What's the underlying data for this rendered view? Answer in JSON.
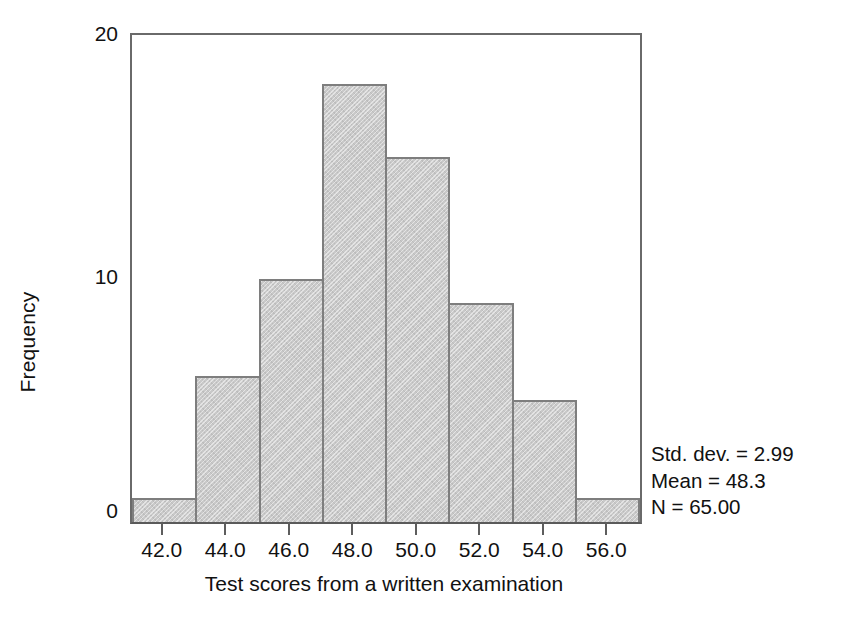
{
  "chart_data": {
    "type": "bar",
    "title": "",
    "subtitle": "",
    "xlabel": "Test scores from a written examination",
    "ylabel": "Frequency",
    "categories": [
      "42.0",
      "44.0",
      "46.0",
      "48.0",
      "50.0",
      "52.0",
      "54.0",
      "56.0"
    ],
    "values": [
      1,
      6,
      10,
      18,
      15,
      9,
      5,
      1
    ],
    "x": [
      42.0,
      44.0,
      46.0,
      48.0,
      50.0,
      52.0,
      54.0,
      56.0
    ],
    "bin_width": 2,
    "bin_edges": [
      41,
      43,
      45,
      47,
      49,
      51,
      53,
      55,
      57
    ],
    "xlim": [
      41,
      57
    ],
    "ylim": [
      0,
      20
    ],
    "ytick_labels": [
      "20",
      "10",
      "0"
    ],
    "ytick_values": [
      20,
      10,
      0
    ],
    "xtick_labels": [
      "42.0",
      "44.0",
      "46.0",
      "48.0",
      "50.0",
      "52.0",
      "54.0",
      "56.0"
    ],
    "grid": false,
    "legend": "none",
    "legend_position": "none",
    "bar_fill_color": "#c9c9c9",
    "bar_border_color": "#7e7e7e",
    "axis_color": "#6a6a6a",
    "annotations": [
      "Std. dev. = 2.99",
      "Mean = 48.3",
      "N = 65.00"
    ],
    "statistics": {
      "std_dev": "2.99",
      "mean": "48.3",
      "n": "65.00"
    }
  },
  "axes": {
    "y_title": "Frequency",
    "x_title": "Test scores from a written examination"
  },
  "stats_box": {
    "line1": "Std. dev. = 2.99",
    "line2": "Mean = 48.3",
    "line3": "N = 65.00"
  }
}
